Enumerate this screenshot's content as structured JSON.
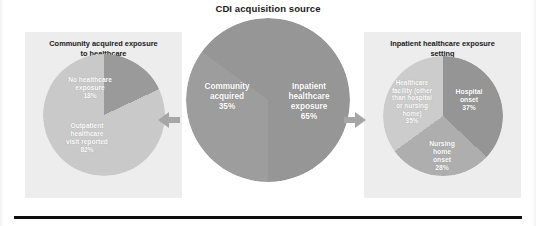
{
  "chart_data": {
    "type": "pie",
    "title": "CDI acquisition source",
    "legend_position": "none",
    "grid": false,
    "charts": [
      {
        "id": "community-acquired-exposure",
        "title": "Community acquired exposure to healthcare",
        "categories": [
          "No healthcare exposure",
          "Outpatient healthcare visit reported"
        ],
        "values": [
          18,
          82
        ],
        "value_labels": [
          "18%",
          "82%"
        ],
        "colors": [
          "#9a9a9a",
          "#c9c9c9"
        ]
      },
      {
        "id": "cdi-acquisition-source",
        "title": "CDI acquisition source",
        "categories": [
          "Community acquired",
          "Inpatient healthcare exposure"
        ],
        "values": [
          35,
          65
        ],
        "value_labels": [
          "35%",
          "65%"
        ],
        "colors": [
          "#9d9d9d",
          "#969696"
        ]
      },
      {
        "id": "inpatient-healthcare-exposure-setting",
        "title": "Inpatient healthcare exposure setting",
        "categories": [
          "Hospital onset",
          "Nursing home onset",
          "Healthcare facility (other than hospital or nursing home)"
        ],
        "values": [
          37,
          28,
          35
        ],
        "value_labels": [
          "37%",
          "28%",
          "35%"
        ],
        "colors": [
          "#959595",
          "#aeaeae",
          "#cccccc"
        ]
      }
    ]
  },
  "title": "CDI acquisition source",
  "panels": {
    "left": {
      "header_line1": "Community acquired exposure",
      "header_line2": "to healthcare"
    },
    "right": {
      "header_line1": "Inpatient healthcare exposure",
      "header_line2": "setting"
    }
  },
  "labels": {
    "left_pie": {
      "no_exposure": "No healthcare\nexposure\n18%",
      "outpatient": "Outpatient\nhealthcare\nvisit reported\n82%"
    },
    "center_pie": {
      "community": "Community\nacquired\n35%",
      "inpatient": "Inpatient\nhealthcare\nexposure\n65%"
    },
    "right_pie": {
      "hospital": "Hospital\nonset\n37%",
      "nursing": "Nursing\nhome\nonset\n28%",
      "facility": "Healthcare\nfacility (other\nthan hospital\nor nursing\nhome)\n35%"
    }
  },
  "arrows": {
    "left_direction": "left",
    "right_direction": "right"
  }
}
